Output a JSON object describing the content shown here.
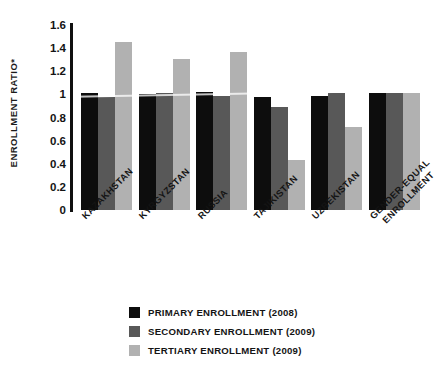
{
  "chart_data": {
    "type": "bar",
    "title": "",
    "xlabel": "",
    "ylabel": "ENROLLMENT RATIO*",
    "ylim": [
      0,
      1.6
    ],
    "ytick_labels": [
      "1.6",
      "1.4",
      "1.2",
      "1",
      "0.8",
      "0.6",
      "0.4",
      "0.2",
      "0"
    ],
    "ytick_values": [
      1.6,
      1.4,
      1.2,
      1.0,
      0.8,
      0.6,
      0.4,
      0.2,
      0
    ],
    "grid": false,
    "legend_position": "bottom-center",
    "categories": [
      "KAZAKHSTAN",
      "KYRGYZSTAN",
      "RUSSIA",
      "TAJIKISTAN",
      "UZBEKISTAN",
      "GENDER-EQUAL ENROLLMENT"
    ],
    "category_lines": [
      [
        "KAZAKHSTAN"
      ],
      [
        "KYRGYZSTAN"
      ],
      [
        "RUSSIA"
      ],
      [
        "TAJIKISTAN"
      ],
      [
        "UZBEKISTAN"
      ],
      [
        "GENDER-EQUAL",
        "ENROLLMENT"
      ]
    ],
    "series": [
      {
        "name": "PRIMARY ENROLLMENT (2008)",
        "color": "#0d0d0d",
        "values": [
          1.01,
          1.0,
          1.02,
          0.98,
          0.99,
          1.01
        ]
      },
      {
        "name": "SECONDARY ENROLLMENT (2009)",
        "color": "#585858",
        "values": [
          0.98,
          1.01,
          0.99,
          0.89,
          1.01,
          1.01
        ]
      },
      {
        "name": "TERTIARY ENROLLMENT (2009)",
        "color": "#b1b1b1",
        "values": [
          1.45,
          1.31,
          1.37,
          0.43,
          0.72,
          1.01
        ]
      }
    ]
  },
  "legend": {
    "items": [
      {
        "label": "PRIMARY ENROLLMENT (2008)",
        "color": "#0d0d0d"
      },
      {
        "label": "SECONDARY ENROLLMENT (2009)",
        "color": "#585858"
      },
      {
        "label": "TERTIARY ENROLLMENT (2009)",
        "color": "#b1b1b1"
      }
    ]
  },
  "axis": {
    "y_title": "ENROLLMENT RATIO*"
  }
}
